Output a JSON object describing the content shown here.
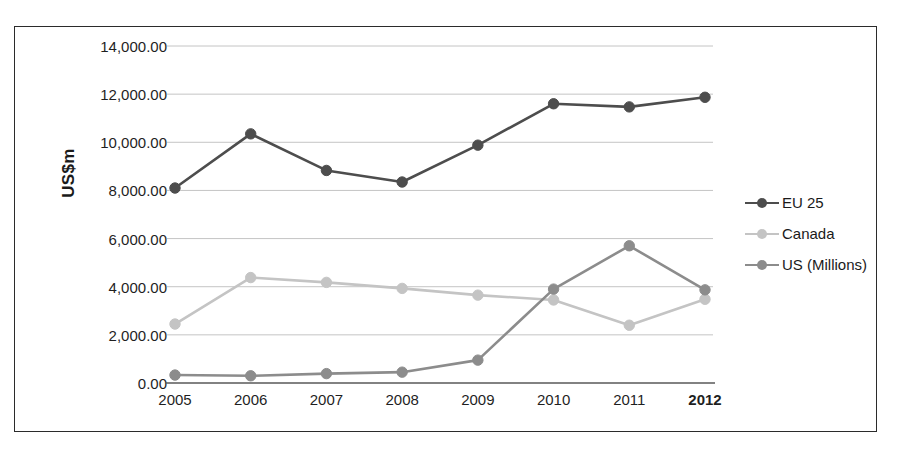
{
  "chart_data": {
    "type": "line",
    "title": "",
    "xlabel": "",
    "ylabel": "US$m",
    "x": [
      "2005",
      "2006",
      "2007",
      "2008",
      "2009",
      "2010",
      "2011",
      "2012"
    ],
    "categories": [
      "2005",
      "2006",
      "2007",
      "2008",
      "2009",
      "2010",
      "2011",
      "2012"
    ],
    "ylim": [
      0,
      14000
    ],
    "ytick_values": [
      0,
      2000,
      4000,
      6000,
      8000,
      10000,
      12000,
      14000
    ],
    "ytick_labels": [
      "0.00",
      "2,000.00",
      "4,000.00",
      "6,000.00",
      "8,000.00",
      "10,000.00",
      "12,000.00",
      "14,000.00"
    ],
    "grid": true,
    "legend_position": "right",
    "series": [
      {
        "name": "EU 25",
        "color": "#4d4d4d",
        "values": [
          8100,
          10350,
          8830,
          8350,
          9880,
          11600,
          11470,
          11870
        ]
      },
      {
        "name": "Canada",
        "color": "#c4c4c4",
        "values": [
          2450,
          4380,
          4180,
          3930,
          3650,
          3450,
          2400,
          3480
        ]
      },
      {
        "name": "US (Millions)",
        "color": "#8c8c8c",
        "values": [
          330,
          300,
          390,
          450,
          950,
          3900,
          5700,
          3870
        ]
      }
    ]
  },
  "axis": {
    "y_title": "US$m"
  },
  "legend": {
    "items": [
      {
        "label": "EU 25",
        "color": "#4d4d4d"
      },
      {
        "label": "Canada",
        "color": "#c4c4c4"
      },
      {
        "label": "US (Millions)",
        "color": "#8c8c8c"
      }
    ]
  },
  "style": {
    "border_color": "#2b2b2b",
    "grid_color": "#bdbdbd",
    "axis_color": "#595959",
    "background": "#ffffff"
  }
}
